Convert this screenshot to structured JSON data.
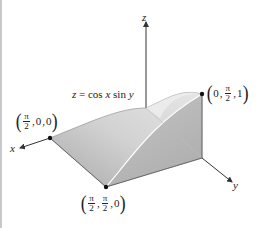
{
  "figure": {
    "equation": "z = cos x sin y",
    "axes": {
      "x_label": "x",
      "y_label": "y",
      "z_label": "z"
    },
    "points": [
      {
        "name": "point-pi2-0-0",
        "parts": [
          "π",
          "2",
          "0",
          "0"
        ],
        "text": "(π/2, 0, 0)"
      },
      {
        "name": "point-pi2-pi2-0",
        "parts": [
          "π",
          "2",
          "π",
          "2",
          "0"
        ],
        "text": "(π/2, π/2, 0)"
      },
      {
        "name": "point-0-pi2-1",
        "parts": [
          "0",
          "π",
          "2",
          "1"
        ],
        "text": "(0, π/2, 1)"
      }
    ],
    "colors": {
      "surface_light": "#e4e4e4",
      "surface_mid": "#c4c4c4",
      "surface_dark": "#a8a8a8",
      "axis": "#333333",
      "text": "#222222"
    }
  }
}
